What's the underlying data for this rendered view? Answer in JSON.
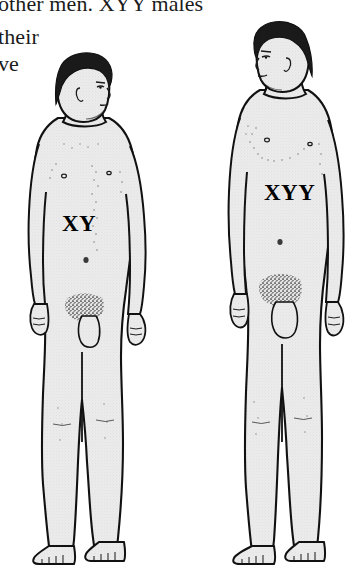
{
  "page": {
    "background_color": "#ffffff",
    "width": 361,
    "height": 576,
    "kind": "scanned-textbook-illustration"
  },
  "body_text": {
    "line_1": "other men. XYY males",
    "line_2": "their",
    "line_3": "ve",
    "text_color": "#1b1b1b",
    "note_clipped_top": "first line is cropped along the top edge of the scan"
  },
  "illustration": {
    "caption_free": true,
    "line_color": "#111111",
    "skin_fill_color": "#e9e9e9",
    "hair_color": "#1a1a1a",
    "shadow_color": "#cfcfcf",
    "figures": [
      {
        "id": "figure-xy",
        "label": "XY",
        "description": "standing nude male figure, shorter, head turned to the right",
        "label_position": "mid-abdomen",
        "head_facing": "right"
      },
      {
        "id": "figure-xyy",
        "label": "XYY",
        "description": "standing nude male figure, taller, head turned to the left",
        "label_position": "upper-abdomen",
        "head_facing": "left"
      }
    ]
  }
}
